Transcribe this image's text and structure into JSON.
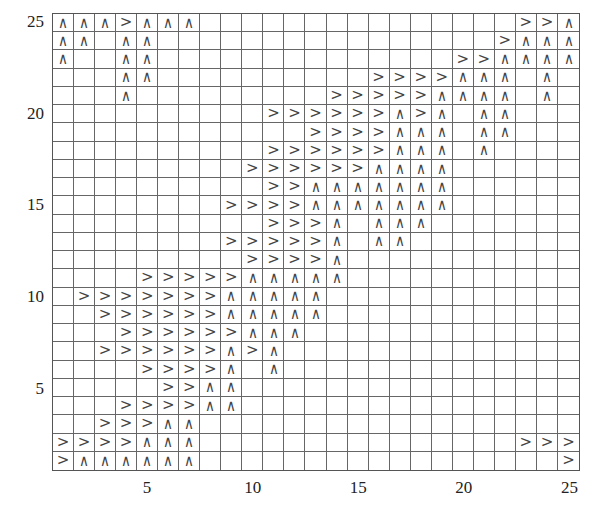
{
  "grid": {
    "rows": 25,
    "cols": 25,
    "symbols": {
      "R": ">",
      "U": "∧"
    },
    "cells_by_row_top_to_bottom": {
      "25": {
        "1": "U",
        "2": "U",
        "3": "U",
        "4": "R",
        "5": "U",
        "6": "U",
        "7": "U",
        "23": "R",
        "24": "R",
        "25": "U"
      },
      "24": {
        "1": "U",
        "2": "U",
        "4": "U",
        "5": "U",
        "22": "R",
        "23": "U",
        "24": "U",
        "25": "U"
      },
      "23": {
        "1": "U",
        "4": "U",
        "5": "U",
        "20": "R",
        "21": "R",
        "22": "U",
        "23": "U",
        "24": "U",
        "25": "U"
      },
      "22": {
        "4": "U",
        "5": "U",
        "16": "R",
        "17": "R",
        "18": "R",
        "19": "R",
        "20": "U",
        "21": "U",
        "22": "U",
        "24": "U"
      },
      "21": {
        "4": "U",
        "14": "R",
        "15": "R",
        "16": "R",
        "17": "R",
        "18": "R",
        "19": "U",
        "20": "U",
        "21": "U",
        "22": "U",
        "24": "U"
      },
      "20": {
        "11": "R",
        "12": "R",
        "13": "R",
        "14": "R",
        "15": "R",
        "16": "R",
        "17": "U",
        "18": "R",
        "19": "U",
        "21": "U",
        "22": "U"
      },
      "19": {
        "13": "R",
        "14": "R",
        "15": "R",
        "16": "R",
        "17": "U",
        "18": "U",
        "19": "U",
        "21": "U",
        "22": "U"
      },
      "18": {
        "11": "R",
        "12": "R",
        "13": "R",
        "14": "R",
        "15": "R",
        "16": "R",
        "17": "U",
        "18": "U",
        "19": "U",
        "21": "U"
      },
      "17": {
        "10": "R",
        "11": "R",
        "12": "R",
        "13": "R",
        "14": "R",
        "15": "R",
        "16": "U",
        "17": "U",
        "18": "U",
        "19": "U"
      },
      "16": {
        "11": "R",
        "12": "R",
        "13": "U",
        "14": "U",
        "15": "U",
        "16": "U",
        "17": "U",
        "18": "U",
        "19": "U"
      },
      "15": {
        "9": "R",
        "10": "R",
        "11": "R",
        "12": "R",
        "13": "U",
        "14": "U",
        "15": "U",
        "16": "U",
        "17": "U",
        "18": "U",
        "19": "U"
      },
      "14": {
        "11": "R",
        "12": "R",
        "13": "R",
        "14": "U",
        "16": "U",
        "17": "U",
        "18": "U"
      },
      "13": {
        "9": "R",
        "10": "R",
        "11": "R",
        "12": "R",
        "13": "R",
        "14": "U",
        "16": "U",
        "17": "U"
      },
      "12": {
        "10": "R",
        "11": "R",
        "12": "R",
        "13": "R",
        "14": "U"
      },
      "11": {
        "5": "R",
        "6": "R",
        "7": "R",
        "8": "R",
        "9": "R",
        "10": "U",
        "11": "U",
        "12": "U",
        "13": "U",
        "14": "U"
      },
      "10": {
        "2": "R",
        "3": "R",
        "4": "R",
        "5": "R",
        "6": "R",
        "7": "R",
        "8": "R",
        "9": "U",
        "10": "U",
        "11": "U",
        "12": "U",
        "13": "U"
      },
      "9": {
        "3": "R",
        "4": "R",
        "5": "R",
        "6": "R",
        "7": "R",
        "8": "R",
        "9": "U",
        "10": "U",
        "11": "U",
        "12": "U",
        "13": "U"
      },
      "8": {
        "4": "R",
        "5": "R",
        "6": "R",
        "7": "R",
        "8": "R",
        "9": "R",
        "10": "U",
        "11": "U",
        "12": "U"
      },
      "7": {
        "3": "R",
        "4": "R",
        "5": "R",
        "6": "R",
        "7": "R",
        "8": "R",
        "9": "U",
        "10": "R",
        "11": "U"
      },
      "6": {
        "5": "R",
        "6": "R",
        "7": "R",
        "8": "R",
        "9": "U",
        "11": "U"
      },
      "5": {
        "6": "R",
        "7": "R",
        "8": "U",
        "9": "U"
      },
      "4": {
        "4": "R",
        "5": "R",
        "6": "R",
        "7": "R",
        "8": "U",
        "9": "U"
      },
      "3": {
        "3": "R",
        "4": "R",
        "5": "R",
        "6": "U",
        "7": "U"
      },
      "2": {
        "1": "R",
        "2": "R",
        "3": "R",
        "4": "R",
        "5": "U",
        "6": "U",
        "7": "U",
        "23": "R",
        "24": "R",
        "25": "R"
      },
      "1": {
        "1": "R",
        "2": "U",
        "3": "U",
        "4": "U",
        "5": "U",
        "6": "U",
        "7": "U",
        "25": "R"
      }
    }
  },
  "axes": {
    "y_ticks": [
      {
        "label": "25",
        "row": 25
      },
      {
        "label": "20",
        "row": 20
      },
      {
        "label": "15",
        "row": 15
      },
      {
        "label": "10",
        "row": 10
      },
      {
        "label": "5",
        "row": 5
      }
    ],
    "x_ticks": [
      {
        "label": "5",
        "col": 5
      },
      {
        "label": "10",
        "col": 10
      },
      {
        "label": "15",
        "col": 15
      },
      {
        "label": "20",
        "col": 20
      },
      {
        "label": "25",
        "col": 25
      }
    ]
  }
}
